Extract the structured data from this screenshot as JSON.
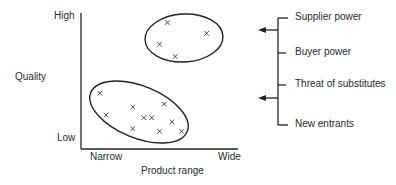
{
  "diagram": {
    "y_axis": {
      "label": "Quality",
      "high": "High",
      "low": "Low"
    },
    "x_axis": {
      "label": "Product range",
      "low": "Narrow",
      "high": "Wide"
    },
    "clusters": [
      {
        "name": "high-quality-wide-range",
        "points": [
          [
            0.55,
            0.93
          ],
          [
            0.8,
            0.85
          ],
          [
            0.5,
            0.77
          ],
          [
            0.6,
            0.68
          ]
        ]
      },
      {
        "name": "low-quality-narrow-range",
        "points": [
          [
            0.12,
            0.41
          ],
          [
            0.16,
            0.25
          ],
          [
            0.33,
            0.31
          ],
          [
            0.4,
            0.23
          ],
          [
            0.45,
            0.23
          ],
          [
            0.53,
            0.33
          ],
          [
            0.58,
            0.2
          ],
          [
            0.33,
            0.15
          ],
          [
            0.5,
            0.13
          ],
          [
            0.64,
            0.13
          ]
        ]
      }
    ],
    "forces": [
      "Supplier power",
      "Buyer power",
      "Threat of substitutes",
      "New entrants"
    ],
    "point_marker": "×"
  }
}
